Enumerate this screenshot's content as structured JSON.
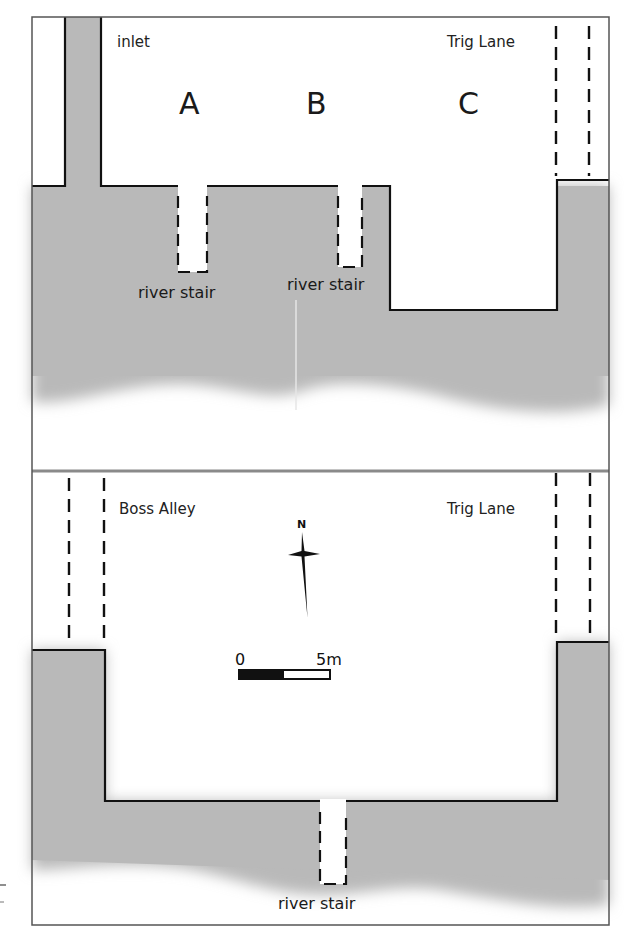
{
  "figure": {
    "type": "archaeological site plan",
    "panels": [
      {
        "name": "upper-plan",
        "labels": {
          "inlet": "inlet",
          "street": "Trig Lane",
          "plot_a": "A",
          "plot_b": "B",
          "plot_c": "C",
          "stair_a": "river stair",
          "stair_b": "river stair"
        }
      },
      {
        "name": "lower-plan",
        "labels": {
          "street_left": "Boss Alley",
          "street_right": "Trig Lane",
          "stair": "river stair"
        },
        "north_arrow": {
          "label": "N",
          "icon": "north-arrow-icon"
        },
        "scale_bar": {
          "start": "0",
          "end": "5m"
        }
      }
    ],
    "colors": {
      "river": "#b9b9b9",
      "land": "#ffffff",
      "line": "#111111",
      "divider": "#8a8a8a"
    }
  }
}
